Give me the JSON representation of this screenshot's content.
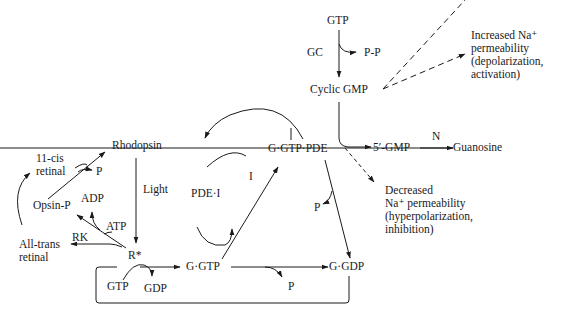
{
  "diagram": {
    "title": "",
    "type": "phototransduction cascade",
    "nodes": {
      "gtp_top": "GTP",
      "gc": "GC",
      "pp": "P-P",
      "cyclic_gmp": "Cyclic GMP",
      "increased_na": "Increased Na⁺\npermeability\n(depolarization,\nactivation)",
      "gmp5": "5′-GMP",
      "n": "N",
      "guanosine": "Guanosine",
      "decreased_na": "Decreased\nNa⁺ permeability\n(hyperpolarization,\ninhibition)",
      "rhodopsin": "Rhodopsin",
      "light": "Light",
      "cis_retinal": "11-cis\nretinal",
      "p_top_left": "P",
      "opsin_p": "Opsin-P",
      "adp": "ADP",
      "atp": "ATP",
      "rk": "RK",
      "all_trans": "All-trans\nretinal",
      "r_star": "R*",
      "g_gtp_pde": "G·GTP·PDE",
      "pde_i": "PDE·I",
      "i": "I",
      "p_mid": "P",
      "g_gtp": "G·GTP",
      "g_gdp": "G·GDP",
      "gtp_box": "GTP",
      "gdp_box": "GDP",
      "p_bottom": "P"
    },
    "edges": [
      {
        "from": "GTP",
        "to": "Cyclic GMP",
        "label": "GC",
        "byproduct": "P-P"
      },
      {
        "from": "Cyclic GMP",
        "to": "Increased Na+ permeability",
        "style": "dashed"
      },
      {
        "from": "Cyclic GMP",
        "to": "5'-GMP",
        "enzyme": "G·GTP·PDE"
      },
      {
        "from": "5'-GMP",
        "to": "Guanosine",
        "label": "N"
      },
      {
        "from": "G·GTP·PDE",
        "to": "Decreased Na+ permeability",
        "style": "dashed"
      },
      {
        "from": "Rhodopsin",
        "to": "R*",
        "label": "Light"
      },
      {
        "from": "R*",
        "to": "All-trans retinal",
        "label": "RK"
      },
      {
        "from": "R*",
        "to": "Opsin-P",
        "cofactor": "ATP",
        "byproduct": "ADP"
      },
      {
        "from": "Opsin-P",
        "to": "Rhodopsin",
        "cofactor": "11-cis retinal",
        "byproduct": "P"
      },
      {
        "from": "All-trans retinal",
        "to": "11-cis retinal"
      },
      {
        "from": "R*",
        "to": "G·GTP",
        "cofactor": "GTP",
        "byproduct": "GDP"
      },
      {
        "from": "G·GTP",
        "to": "G·GTP·PDE",
        "cofactor": "PDE·I",
        "byproduct": "I"
      },
      {
        "from": "G·GTP",
        "to": "G·GDP",
        "byproduct": "P"
      },
      {
        "from": "G·GTP·PDE",
        "to": "G·GDP",
        "byproduct": "P"
      },
      {
        "from": "G·GTP·PDE",
        "to": "PDE·I"
      },
      {
        "from": "G·GDP",
        "to": "R*",
        "style": "box-loop"
      }
    ]
  }
}
